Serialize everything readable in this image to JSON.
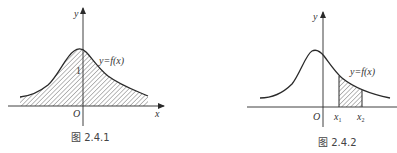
{
  "figures": [
    {
      "id": "fig1",
      "caption": "图 2.4.1",
      "axis_x_label": "x",
      "axis_y_label": "y",
      "origin_label": "O",
      "tick_y_label": "1",
      "curve_label": "y=f(x)",
      "shading": "entire area under curve"
    },
    {
      "id": "fig2",
      "caption": "图 2.4.2",
      "axis_x_label": "x",
      "axis_y_label": "y",
      "origin_label": "O",
      "curve_label": "y=f(x)",
      "x1_label": "x",
      "x1_sub": "1",
      "x2_label": "x",
      "x2_sub": "2",
      "shading": "area under curve between x1 and x2"
    }
  ],
  "colors": {
    "line": "#2a2a2a",
    "hatch": "#555555",
    "text": "#333333"
  }
}
